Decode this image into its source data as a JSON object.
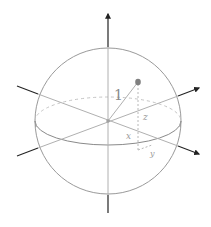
{
  "diagram": {
    "colors": {
      "background": "#ffffff",
      "sphere_outline": "#9a9a9a",
      "axis_outer": "#222222",
      "axis_inner": "#b0b0b0",
      "point": "#808080",
      "dashed": "#b8b8b8",
      "label": "#9a9a9a"
    },
    "labels": {
      "radius": "1",
      "z": "z",
      "x": "x",
      "y": "y"
    },
    "elements": [
      {
        "type": "sphere",
        "center": [
          108,
          121
        ],
        "radius": 73
      },
      {
        "type": "equator",
        "rx": 73,
        "ry": 24,
        "back": "dashed",
        "front": "solid"
      },
      {
        "type": "axis",
        "name": "vertical",
        "from": [
          108,
          212
        ],
        "to": [
          108,
          12
        ],
        "arrow": "top"
      },
      {
        "type": "axis",
        "name": "diagonal-down",
        "from": [
          17,
          86
        ],
        "to": [
          200,
          154
        ],
        "arrow": "end"
      },
      {
        "type": "axis",
        "name": "diagonal-up",
        "from": [
          17,
          156
        ],
        "to": [
          200,
          88
        ],
        "arrow": "end"
      },
      {
        "type": "point",
        "at": [
          138,
          82
        ]
      },
      {
        "type": "radius-line",
        "from": [
          108,
          121
        ],
        "to": [
          138,
          82
        ],
        "label": "1"
      },
      {
        "type": "projection",
        "from": [
          138,
          82
        ],
        "to": [
          138,
          150
        ],
        "style": "dashed",
        "label": "z"
      }
    ]
  }
}
